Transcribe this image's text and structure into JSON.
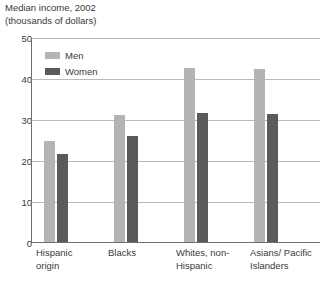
{
  "chart_data": {
    "type": "bar",
    "title": "Median income, 2002",
    "title_line1": "Median income, 2002",
    "title_line2": "(thousands of dollars)",
    "subtitle": "(thousands of dollars)",
    "xlabel": "",
    "ylabel": "",
    "ylim": [
      0,
      50
    ],
    "yticks": [
      0,
      10,
      20,
      30,
      40,
      50
    ],
    "ytick_labels": [
      "0",
      "10",
      "20",
      "30",
      "40",
      "50"
    ],
    "grid": true,
    "legend_position": "top-left-inside",
    "categories": [
      "Hispanic origin",
      "Blacks",
      "Whites, non-Hispanic",
      "Asians/ Pacific Islanders"
    ],
    "category_lines": [
      [
        "Hispanic",
        "origin"
      ],
      [
        "Blacks",
        ""
      ],
      [
        "Whites, non-",
        "Hispanic"
      ],
      [
        "Asians/ Pacific",
        "Islanders"
      ]
    ],
    "series": [
      {
        "name": "Men",
        "color": "#b4b4b4",
        "values": [
          24.8,
          31.2,
          42.7,
          42.3
        ]
      },
      {
        "name": "Women",
        "color": "#5a5a5a",
        "values": [
          21.5,
          26.0,
          31.7,
          31.4
        ]
      }
    ]
  },
  "colors": {
    "men": "#b4b4b4",
    "women": "#5a5a5a",
    "gridline": "#b9b9b9",
    "axis": "#6f6f6f",
    "text": "#3a3a3a",
    "background": "#ffffff"
  }
}
